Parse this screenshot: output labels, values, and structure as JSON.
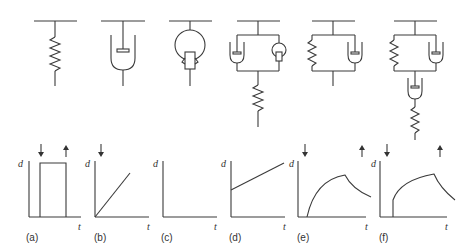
{
  "figure": {
    "panels": [
      {
        "id": "a",
        "label": "(a)",
        "model": "spring",
        "xlabel": "t",
        "ylabel": "d",
        "response": "step on at load, step off at unload",
        "arrows": [
          "load-down",
          "unload-up"
        ]
      },
      {
        "id": "b",
        "label": "(b)",
        "model": "dashpot",
        "xlabel": "t",
        "ylabel": "d",
        "response": "linear increase from origin",
        "arrows": [
          "load-down"
        ]
      },
      {
        "id": "c",
        "label": "(c)",
        "model": "dashpot-with-friction-element",
        "xlabel": "t",
        "ylabel": "d",
        "response": "no deformation",
        "arrows": []
      },
      {
        "id": "d",
        "label": "(d)",
        "model": "dashpot and friction in parallel, in series with spring",
        "xlabel": "t",
        "ylabel": "d",
        "response": "linear increase from nonzero intercept",
        "arrows": []
      },
      {
        "id": "e",
        "label": "(e)",
        "model": "spring and dashpot in parallel (Kelvin)",
        "xlabel": "t",
        "ylabel": "d",
        "response": "delayed elastic rise then recovery decay",
        "arrows": [
          "load-down",
          "unload-up"
        ]
      },
      {
        "id": "f",
        "label": "(f)",
        "model": "Burgers: Kelvin unit in series with dashpot and spring",
        "xlabel": "t",
        "ylabel": "d",
        "response": "rise with creep then partial recovery",
        "arrows": [
          "load-down",
          "unload-up"
        ]
      }
    ]
  }
}
